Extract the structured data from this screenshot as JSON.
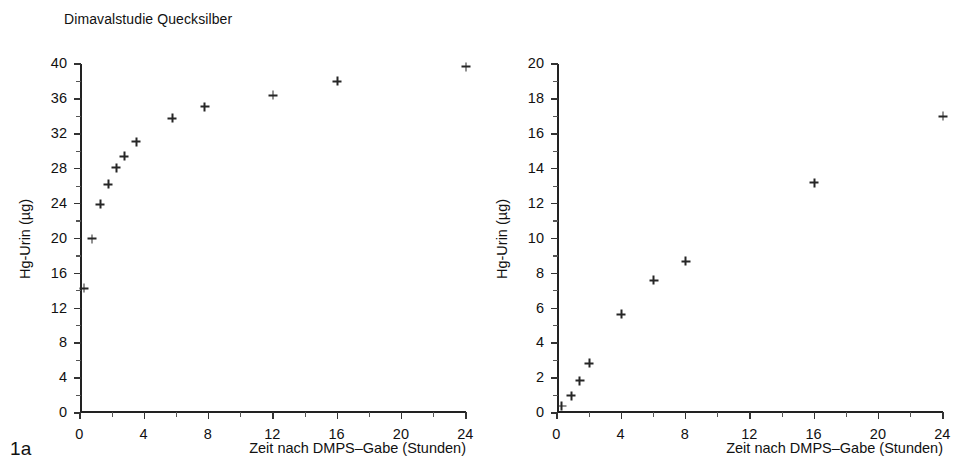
{
  "figure": {
    "panels": [
      {
        "tag": "1a",
        "title": "Dimavalstudie Quecksilber",
        "ylabel": "Hg-Urin (µg)",
        "xlabel": "Zeit nach DMPS–Gabe (Stunden)"
      },
      {
        "tag": "1b",
        "title": "Dimavalstudie Quecksilber",
        "ylabel": "Hg-Urin (µg)",
        "xlabel": "Zeit nach DMPS–Gabe (Stunden)"
      }
    ]
  },
  "chart_data": [
    {
      "type": "scatter",
      "title": "Dimavalstudie Quecksilber",
      "tag": "1a",
      "xlabel": "Zeit nach DMPS-Gabe (Stunden)",
      "ylabel": "Hg-Urin (µg)",
      "xlim": [
        0,
        24
      ],
      "ylim": [
        0,
        40
      ],
      "xticks": [
        0,
        4,
        8,
        12,
        16,
        20,
        24
      ],
      "xticklabels": [
        "0",
        "4",
        "8",
        "12",
        "16",
        "20",
        "24"
      ],
      "xminorticks": [
        2,
        6,
        10,
        14,
        18,
        22
      ],
      "yticks": [
        0,
        4,
        8,
        12,
        16,
        20,
        24,
        28,
        32,
        36,
        40
      ],
      "yticklabels": [
        "0",
        "4",
        "8",
        "12",
        "16",
        "20",
        "24",
        "28",
        "32",
        "36",
        "40"
      ],
      "grid": false,
      "legend": false,
      "marker": "plus",
      "points": [
        {
          "x": 0.25,
          "y": 14.3
        },
        {
          "x": 0.75,
          "y": 20.0
        },
        {
          "x": 1.25,
          "y": 23.9
        },
        {
          "x": 1.75,
          "y": 26.2
        },
        {
          "x": 2.25,
          "y": 28.1
        },
        {
          "x": 2.75,
          "y": 29.4
        },
        {
          "x": 3.5,
          "y": 31.1
        },
        {
          "x": 5.75,
          "y": 33.8
        },
        {
          "x": 7.75,
          "y": 35.1
        },
        {
          "x": 12.0,
          "y": 36.4
        },
        {
          "x": 16.0,
          "y": 38.0
        },
        {
          "x": 24.0,
          "y": 39.7
        }
      ]
    },
    {
      "type": "scatter",
      "title": "Dimavalstudie Quecksilber",
      "tag": "1b",
      "xlabel": "Zeit nach DMPS-Gabe (Stunden)",
      "ylabel": "Hg-Urin (µg)",
      "xlim": [
        0,
        24
      ],
      "ylim": [
        0,
        20
      ],
      "xticks": [
        0,
        4,
        8,
        12,
        16,
        20,
        24
      ],
      "xticklabels": [
        "0",
        "4",
        "8",
        "12",
        "16",
        "20",
        "24"
      ],
      "xminorticks": [
        2,
        6,
        10,
        14,
        18,
        22
      ],
      "yticks": [
        0,
        2,
        4,
        6,
        8,
        10,
        12,
        14,
        16,
        18,
        20
      ],
      "yticklabels": [
        "0",
        "2",
        "4",
        "6",
        "8",
        "10",
        "12",
        "14",
        "16",
        "18",
        "20"
      ],
      "grid": false,
      "legend": false,
      "marker": "plus",
      "points": [
        {
          "x": 0.3,
          "y": 0.4
        },
        {
          "x": 0.9,
          "y": 1.0
        },
        {
          "x": 1.4,
          "y": 1.85
        },
        {
          "x": 2.0,
          "y": 2.85
        },
        {
          "x": 4.0,
          "y": 5.65
        },
        {
          "x": 6.0,
          "y": 7.6
        },
        {
          "x": 8.0,
          "y": 8.7
        },
        {
          "x": 16.0,
          "y": 13.2
        },
        {
          "x": 24.0,
          "y": 17.0
        }
      ]
    }
  ]
}
